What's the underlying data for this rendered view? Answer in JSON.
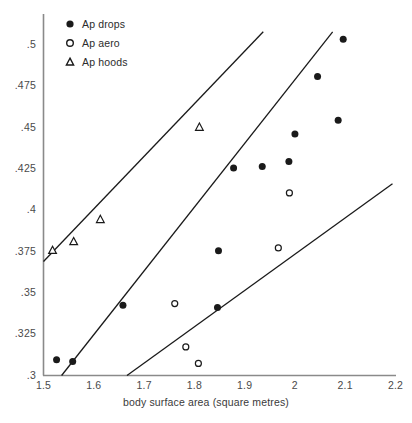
{
  "chart_data": {
    "type": "scatter",
    "title": "",
    "xlabel": "body surface area (square metres)",
    "ylabel": "",
    "xlim": [
      1.5,
      2.2
    ],
    "ylim": [
      0.3,
      0.5
    ],
    "grid": false,
    "legend_position": "top-left",
    "x_ticks": [
      "1.5",
      "1.6",
      "1.7",
      "1.8",
      "1.9",
      "2",
      "2.1",
      "2.2"
    ],
    "x_tick_values": [
      1.5,
      1.6,
      1.7,
      1.8,
      1.9,
      2.0,
      2.1,
      2.2
    ],
    "y_ticks": [
      ".3",
      ".325",
      ".35",
      ".375",
      ".4",
      ".425",
      ".45",
      ".475",
      ".5"
    ],
    "y_tick_values": [
      0.3,
      0.325,
      0.35,
      0.375,
      0.4,
      0.425,
      0.45,
      0.475,
      0.5
    ],
    "series": [
      {
        "name": "Ap drops",
        "marker": "filled-circle",
        "color": "#1a1a1a",
        "points": [
          [
            1.526,
            0.3095
          ],
          [
            1.558,
            0.3085
          ],
          [
            1.658,
            0.3425
          ],
          [
            1.846,
            0.3411
          ],
          [
            1.848,
            0.3755
          ],
          [
            1.878,
            0.4255
          ],
          [
            1.935,
            0.4265
          ],
          [
            1.988,
            0.4295
          ],
          [
            2.0,
            0.4462
          ],
          [
            2.045,
            0.481
          ],
          [
            2.086,
            0.4545
          ],
          [
            2.096,
            0.5035
          ]
        ]
      },
      {
        "name": "Ap aero",
        "marker": "open-circle",
        "color": "#1a1a1a",
        "points": [
          [
            1.761,
            0.3435
          ],
          [
            1.783,
            0.3173
          ],
          [
            1.808,
            0.3073
          ],
          [
            1.989,
            0.4105
          ],
          [
            1.967,
            0.3772
          ]
        ]
      },
      {
        "name": "Ap hoods",
        "marker": "triangle",
        "color": "#1a1a1a",
        "points": [
          [
            1.518,
            0.3757
          ],
          [
            1.56,
            0.381
          ],
          [
            1.613,
            0.3944
          ],
          [
            1.81,
            0.4502
          ]
        ]
      }
    ],
    "fit_lines": [
      {
        "name": "ap-hoods-fit-line",
        "x1": 1.5,
        "y1": 0.369,
        "x2": 1.937,
        "y2": 0.508
      },
      {
        "name": "ap-drops-fit-line",
        "x1": 1.536,
        "y1": 0.3,
        "x2": 2.075,
        "y2": 0.508
      },
      {
        "name": "ap-aero-fit-line",
        "x1": 1.666,
        "y1": 0.3,
        "x2": 2.194,
        "y2": 0.416
      }
    ]
  },
  "axes": {
    "x_title": "body surface area (square metres)"
  },
  "legend": {
    "items": [
      {
        "label": "Ap drops",
        "marker": "filled-circle"
      },
      {
        "label": "Ap aero",
        "marker": "open-circle"
      },
      {
        "label": "Ap hoods",
        "marker": "triangle"
      }
    ]
  },
  "colors": {
    "axis": "#888888",
    "marker": "#1a1a1a",
    "line": "#1a1a1a",
    "tick_text": "#4a4a4a"
  }
}
